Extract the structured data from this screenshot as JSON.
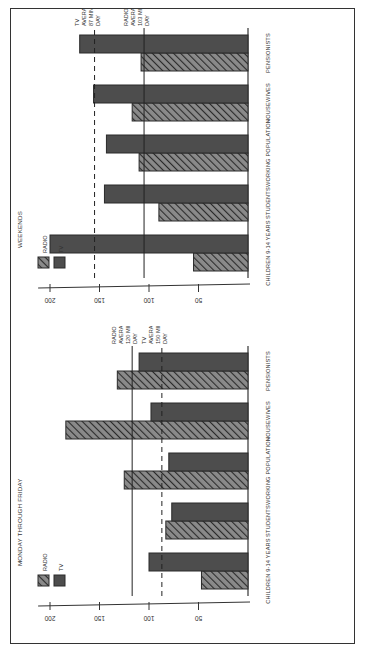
{
  "chart_data": [
    {
      "type": "bar",
      "title": "MONDAY THROUGH FRIDAY",
      "categories": [
        "CHILDREN 9-14 YEARS",
        "STUDENTS",
        "WORKING POPULATION",
        "HOUSEWIVES",
        "PENSIONISTS"
      ],
      "series": [
        {
          "name": "RADIO",
          "pattern": "hatched",
          "values": [
            47,
            83,
            125,
            184,
            132
          ]
        },
        {
          "name": "TV",
          "pattern": "solid",
          "values": [
            100,
            77,
            80,
            98,
            110
          ]
        }
      ],
      "reference_lines": [
        {
          "name": "RADIO AVERAGE",
          "label": "RADIO AVERAGE 120 MINS/ DAY",
          "labeled_value": 120,
          "drawn_at": 117,
          "style": "solid"
        },
        {
          "name": "TV AVERAGE",
          "label": "TV AVERAGE 150 MINS/ DAY",
          "labeled_value": 150,
          "drawn_at": 87,
          "style": "dashed"
        }
      ],
      "xlabel": "",
      "ylabel": "",
      "yticks": [
        50,
        100,
        150,
        200
      ],
      "ylim": [
        0,
        220
      ],
      "legend": [
        "RADIO",
        "TV"
      ],
      "legend_position": "upper-left",
      "grid": false
    },
    {
      "type": "bar",
      "title": "WEEKENDS",
      "categories": [
        "CHILDREN 9-14 YEARS",
        "STUDENTS",
        "WORKING POPULATION",
        "HOUSEWIVES",
        "PENSIONISTS"
      ],
      "series": [
        {
          "name": "RADIO",
          "pattern": "hatched",
          "values": [
            55,
            90,
            110,
            117,
            108
          ]
        },
        {
          "name": "TV",
          "pattern": "solid",
          "values": [
            200,
            145,
            143,
            156,
            170
          ]
        }
      ],
      "reference_lines": [
        {
          "name": "TV AVERAGE",
          "label": "TV AVERAGE 87 MINS/ DAY",
          "labeled_value": 87,
          "drawn_at": 155,
          "style": "dashed"
        },
        {
          "name": "RADIO AVERAGE",
          "label": "RADIO AVERAGE 103 MINS/ DAY",
          "labeled_value": 103,
          "drawn_at": 105,
          "style": "solid"
        }
      ],
      "xlabel": "",
      "ylabel": "",
      "yticks": [
        50,
        100,
        150,
        200
      ],
      "ylim": [
        0,
        220
      ],
      "legend": [
        "RADIO",
        "TV"
      ],
      "legend_position": "upper-left",
      "grid": false
    }
  ],
  "legend": {
    "radio": "RADIO",
    "tv": "TV"
  },
  "colors": {
    "bar_fill": "#4a4a4a",
    "hatch_fill": "#6a6a6a",
    "frame": "#333333"
  },
  "panels": {
    "weekday": {
      "title": "MONDAY THROUGH FRIDAY",
      "radio_avg_label": [
        "RADIO",
        "AVERAGE",
        "120 MINS/",
        "DAY"
      ],
      "tv_avg_label": [
        "TV",
        "AVERAGE",
        "150 MINS/",
        "DAY"
      ]
    },
    "weekend": {
      "title": "WEEKENDS",
      "tv_avg_label": [
        "TV",
        "AVERAGE",
        "87 MINS/",
        "DAY"
      ],
      "radio_avg_label": [
        "RADIO",
        "AVERAGE",
        "103 MINS/",
        "DAY"
      ]
    }
  }
}
